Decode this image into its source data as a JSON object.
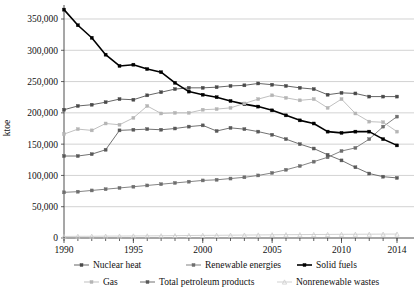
{
  "chart_data": {
    "type": "line",
    "title": "",
    "xlabel": "",
    "ylabel": "ktoe",
    "xlim": [
      1990,
      2014
    ],
    "ylim": [
      0,
      375000
    ],
    "grid": true,
    "legend_position": "bottom",
    "x": [
      1990,
      1991,
      1992,
      1993,
      1994,
      1995,
      1996,
      1997,
      1998,
      1999,
      2000,
      2001,
      2002,
      2003,
      2004,
      2005,
      2006,
      2007,
      2008,
      2009,
      2010,
      2011,
      2012,
      2013,
      2014
    ],
    "xticks": [
      "1990",
      "1995",
      "2000",
      "2005",
      "2010",
      "2014"
    ],
    "yticks": [
      "0",
      "50,000",
      "100,000",
      "150,000",
      "200,000",
      "250,000",
      "300,000",
      "350,000"
    ],
    "series": [
      {
        "name": "Nuclear heat",
        "color": "#4a4a4a",
        "marker": "square",
        "values": [
          205000,
          211000,
          213000,
          217000,
          222000,
          221000,
          228000,
          233000,
          238000,
          240000,
          240000,
          241000,
          243000,
          244000,
          247000,
          245000,
          243000,
          240000,
          238000,
          229000,
          232000,
          231000,
          226000,
          226000,
          226000
        ]
      },
      {
        "name": "Renewable energies",
        "color": "#6e6e6e",
        "marker": "square",
        "values": [
          73000,
          74000,
          76000,
          78000,
          80000,
          82000,
          84000,
          86000,
          88000,
          90000,
          92000,
          93000,
          95000,
          97000,
          100000,
          104000,
          109000,
          115000,
          122000,
          129000,
          139000,
          144000,
          158000,
          178000,
          194000
        ]
      },
      {
        "name": "Solid fuels",
        "color": "#000000",
        "marker": "square",
        "values": [
          365000,
          340000,
          320000,
          293000,
          275000,
          277000,
          270000,
          265000,
          248000,
          234000,
          229000,
          225000,
          219000,
          214000,
          210000,
          204000,
          196000,
          188000,
          183000,
          170000,
          168000,
          170000,
          170000,
          158000,
          148000
        ]
      },
      {
        "name": "Gas",
        "color": "#b5b5b5",
        "marker": "square",
        "values": [
          166000,
          174000,
          172000,
          183000,
          181000,
          192000,
          211000,
          199000,
          200000,
          200000,
          205000,
          206000,
          208000,
          215000,
          222000,
          228000,
          224000,
          220000,
          222000,
          208000,
          222000,
          199000,
          186000,
          185000,
          170000
        ]
      },
      {
        "name": "Total petroleum products",
        "color": "#595959",
        "marker": "square",
        "values": [
          131000,
          131000,
          134000,
          141000,
          172000,
          173000,
          174000,
          173000,
          175000,
          178000,
          180000,
          171000,
          176000,
          174000,
          170000,
          165000,
          158000,
          150000,
          143000,
          133000,
          124000,
          113000,
          103000,
          98000,
          96000
        ]
      },
      {
        "name": "Nonrenewable wastes",
        "color": "#c9c9c9",
        "marker": "triangle",
        "values": [
          2500,
          2700,
          2800,
          3000,
          3100,
          3300,
          3400,
          3600,
          3800,
          4000,
          4200,
          4300,
          4500,
          4700,
          4900,
          5100,
          5300,
          5400,
          5600,
          5700,
          5900,
          6000,
          6100,
          6200,
          6300
        ]
      }
    ]
  },
  "legend": {
    "items": [
      {
        "label": "Nuclear heat"
      },
      {
        "label": "Renewable energies"
      },
      {
        "label": "Solid fuels"
      },
      {
        "label": "Gas"
      },
      {
        "label": "Total petroleum products"
      },
      {
        "label": "Nonrenewable wastes"
      }
    ]
  }
}
